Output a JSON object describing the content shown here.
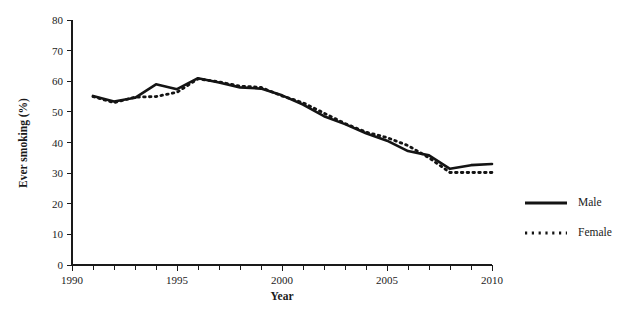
{
  "chart_data": {
    "type": "line",
    "title": "",
    "xlabel": "Year",
    "ylabel": "Ever smoking (%)",
    "xlim": [
      1990,
      2010
    ],
    "ylim": [
      0,
      80
    ],
    "y_ticks": [
      0,
      10,
      20,
      30,
      40,
      50,
      60,
      70,
      80
    ],
    "x_ticks_labeled": [
      1990,
      1995,
      2000,
      2005,
      2010
    ],
    "x_minor_tick_interval": 1,
    "grid": false,
    "legend_position": "right",
    "x": [
      1991,
      1992,
      1993,
      1994,
      1995,
      1996,
      1997,
      1998,
      1999,
      2000,
      2001,
      2002,
      2003,
      2004,
      2005,
      2006,
      2007,
      2008,
      2009,
      2010
    ],
    "series": [
      {
        "name": "Male",
        "style": "solid",
        "color": "#141414",
        "values": [
          55.2,
          53.4,
          54.6,
          59.0,
          57.4,
          61.0,
          59.6,
          58.0,
          57.6,
          55.4,
          52.4,
          48.6,
          46.0,
          43.0,
          40.6,
          37.2,
          35.8,
          31.4,
          32.6,
          33.0
        ]
      },
      {
        "name": "Female",
        "style": "dotted",
        "color": "#141414",
        "values": [
          55.0,
          53.0,
          54.8,
          55.0,
          56.4,
          60.8,
          59.8,
          58.4,
          58.0,
          55.2,
          53.0,
          49.6,
          46.2,
          43.4,
          41.6,
          39.0,
          35.0,
          30.2,
          30.2,
          30.2
        ]
      }
    ]
  },
  "legend": {
    "items": [
      {
        "label": "Male",
        "style": "solid"
      },
      {
        "label": "Female",
        "style": "dotted"
      }
    ]
  },
  "axes": {
    "y_title": "Ever smoking (%)",
    "x_title": "Year",
    "y_tick_labels": [
      "0",
      "10",
      "20",
      "30",
      "40",
      "50",
      "60",
      "70",
      "80"
    ],
    "x_tick_labels": [
      "1990",
      "1995",
      "2000",
      "2005",
      "2010"
    ]
  }
}
